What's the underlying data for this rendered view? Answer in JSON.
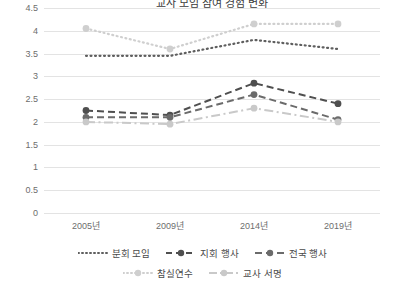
{
  "chart_data": {
    "type": "line",
    "title": "교사 모임 참여 경험 변화",
    "categories": [
      "2005년",
      "2009년",
      "2014년",
      "2019년"
    ],
    "xlabel": "",
    "ylabel": "",
    "ylim": [
      0,
      4.5
    ],
    "yticks": [
      "0",
      "0.5",
      "1",
      "1.5",
      "2",
      "2.5",
      "3",
      "3.5",
      "4",
      "4.5"
    ],
    "grid": true,
    "legend_position": "bottom",
    "series": [
      {
        "name": "분회 모임",
        "values": [
          3.45,
          3.45,
          3.8,
          3.6
        ],
        "color": "#5f5f5f",
        "style": "dotted",
        "marker": "none"
      },
      {
        "name": "지회 행사",
        "values": [
          2.25,
          2.15,
          2.85,
          2.4
        ],
        "color": "#4f4f4f",
        "style": "dashed",
        "marker": "circle"
      },
      {
        "name": "전국 행사",
        "values": [
          2.1,
          2.1,
          2.6,
          2.05
        ],
        "color": "#6b6b6b",
        "style": "dashed",
        "marker": "circle"
      },
      {
        "name": "참실연수",
        "values": [
          4.05,
          3.6,
          4.15,
          4.15
        ],
        "color": "#cfcfcf",
        "style": "dotted",
        "marker": "circle"
      },
      {
        "name": "교사 서명",
        "values": [
          2.0,
          1.95,
          2.3,
          2.0
        ],
        "color": "#c9c9c9",
        "style": "dashdot",
        "marker": "circle"
      }
    ]
  },
  "legend": {
    "row1": [
      "분회 모임",
      "지회 행사",
      "전국 행사"
    ],
    "row2": [
      "참실연수",
      "교사 서명"
    ]
  }
}
